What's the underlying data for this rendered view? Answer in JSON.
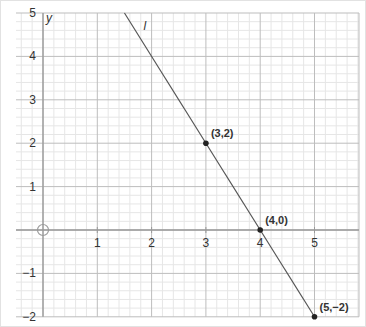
{
  "chart_data": {
    "type": "line",
    "title": "",
    "xlabel": "",
    "ylabel": "y",
    "xlim": [
      -0.5,
      5.8
    ],
    "ylim": [
      -2,
      5
    ],
    "grid": true,
    "minor_grid_per_unit": 5,
    "x_ticks": [
      1,
      2,
      3,
      4,
      5
    ],
    "y_ticks": [
      -2,
      -1,
      1,
      2,
      3,
      4,
      5
    ],
    "line": {
      "name": "l",
      "equation": "y = -2x + 8",
      "slope": -2,
      "intercept": 8,
      "from": [
        1.5,
        5
      ],
      "to": [
        5,
        -2
      ]
    },
    "points": [
      {
        "x": 3,
        "y": 2,
        "label": "(3,2)"
      },
      {
        "x": 4,
        "y": 0,
        "label": "(4,0)"
      },
      {
        "x": 5,
        "y": -2,
        "label": "(5,−2)"
      }
    ],
    "origin_marker": "circle-crosshair"
  },
  "labels": {
    "y_axis": "y",
    "line_name": "l",
    "x_ticks": [
      "1",
      "2",
      "3",
      "4",
      "5"
    ],
    "y_ticks": [
      "5",
      "4",
      "3",
      "2",
      "1",
      "−1",
      "−2"
    ],
    "points": [
      "(3,2)",
      "(4,0)",
      "(5,−2)"
    ]
  },
  "colors": {
    "minor_grid": "#e6e6e6",
    "major_grid": "#bdbdbd",
    "axis": "#9a9a9a",
    "line": "#555555",
    "point": "#222222",
    "text": "#333333"
  }
}
